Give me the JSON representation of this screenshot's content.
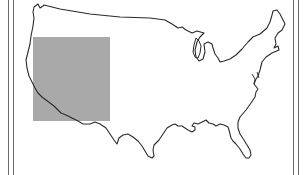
{
  "map": {
    "subject": "United States outline",
    "highlighted_region": {
      "label": "Western region",
      "color": "#a9a9a9",
      "bounds": {
        "x": 33,
        "y": 37,
        "width": 77,
        "height": 84
      }
    },
    "outline_color": "#2a2a2a",
    "frame_color": "#6a6a6a",
    "frame_lines_x": [
      8,
      13,
      293,
      298
    ]
  }
}
